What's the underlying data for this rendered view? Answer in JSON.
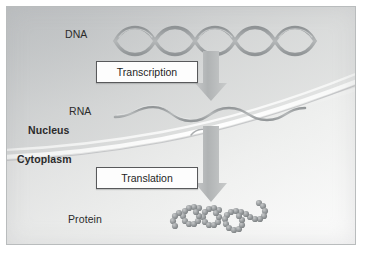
{
  "figure": {
    "background_color": "#e3e4e3",
    "border_color": "#b9bcbd"
  },
  "labels": {
    "dna": "DNA",
    "rna": "RNA",
    "nucleus": "Nucleus",
    "cytoplasm": "Cytoplasm",
    "protein": "Protein"
  },
  "processes": {
    "transcription": "Transcription",
    "translation": "Translation"
  },
  "molecules": {
    "dna_icon": "dna-double-helix",
    "rna_icon": "rna-single-strand",
    "protein_icon": "protein-beaded-chain"
  },
  "arrows": {
    "transcription_arrow": "down-arrow",
    "translation_arrow": "down-arrow",
    "color": "#b0b3b4"
  },
  "colors": {
    "molecule_gray": "#9a9d9f",
    "membrane_light": "#f6f7f6",
    "text": "#2b2b2b",
    "box_border": "#58595b",
    "box_fill": "#fdfdfd"
  }
}
